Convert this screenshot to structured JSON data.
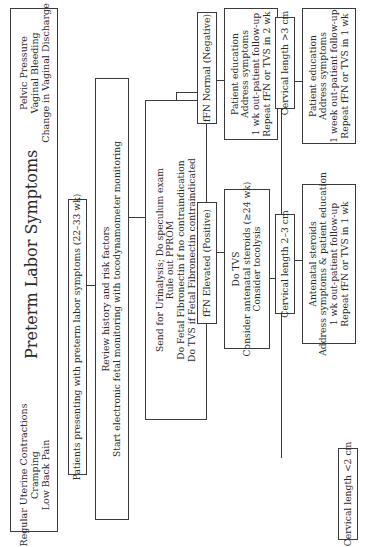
{
  "title": "Preterm Labor Symptoms",
  "symptoms_left": [
    "Regular Uterine Contractions",
    "Cramping",
    "Low Back Pain"
  ],
  "symptoms_right": [
    "Pelvic Pressure",
    "Vaginal Bleeding",
    "Change in Vaginal Discharge"
  ],
  "step1": "Patients presenting with preterm labor symptoms (22–33 wk)",
  "step2": [
    "Review history and risk factors",
    "Start electronic fetal monitoring with tocodynamometer monitoring"
  ],
  "step3": [
    "Send for Urinalysis; Do speculum exam",
    "Rule out PPROM",
    "Do Fetal Fibronectin if no contraindication",
    "Do TVS if Fetal Fibronectin contraindicated"
  ],
  "ffn_normal": {
    "label": "fFN Normal (Negative)",
    "actions": [
      "Patient education",
      "Address symptoms",
      "1 wk out-patient follow-up",
      "Repeat fFN or TVS in 2 wk"
    ]
  },
  "ffn_elevated": {
    "label": "fFN Elevated (Positive)",
    "actions": [
      "Do TVS",
      "Consider antenatal steroids (≥24 wk)",
      "Consider tocolysis"
    ]
  },
  "cervical": [
    {
      "label": "Cervical length >3 cm",
      "actions": [
        "Patient education",
        "Address symptoms",
        "1 week out-patient follow-up",
        "Repeat fFN or TVS in 1 wk"
      ]
    },
    {
      "label": "Cervical length 2–3 cm",
      "actions": [
        "Antenatal steroids",
        "Address symptoms & patient education",
        "1 wk out-patient follow-up",
        "Repeat fFN or TVS in 1 wk"
      ]
    },
    {
      "label": "Cervical length <2 cm",
      "actions": [
        "Antenatal steroids",
        "Tocolysis"
      ]
    }
  ]
}
